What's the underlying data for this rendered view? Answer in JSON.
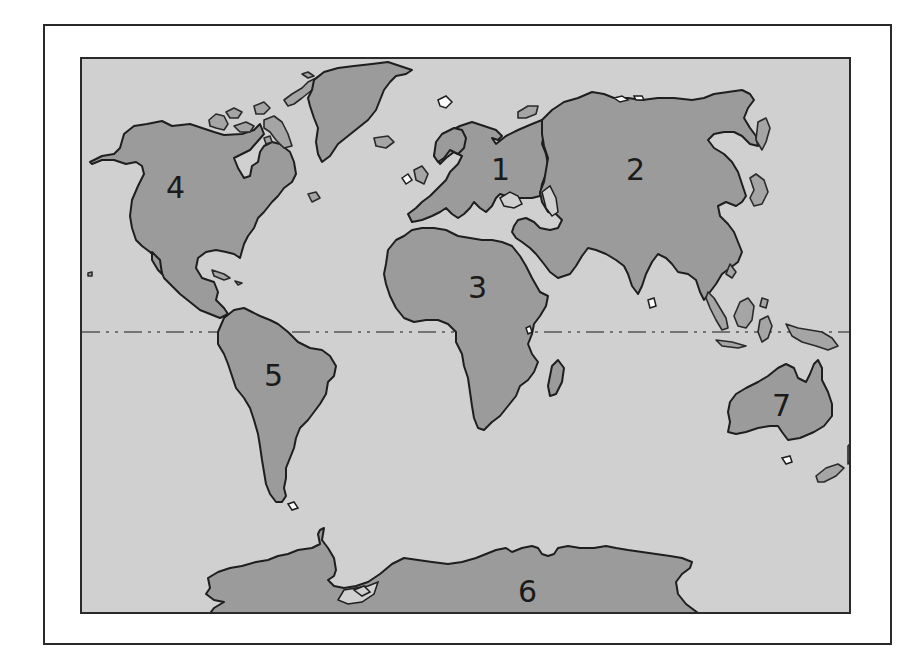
{
  "map": {
    "title": "World continents map",
    "colors": {
      "ocean": "#d0d0d0",
      "land": "#9b9b9b",
      "outline": "#1e1e1e",
      "frame": "#2a2a2a",
      "background": "#ffffff"
    },
    "equator": {
      "style": "dash-dot line",
      "y": 330
    },
    "labels": [
      {
        "id": "1",
        "text": "1",
        "continent": "Europe",
        "x": 490,
        "y": 155
      },
      {
        "id": "2",
        "text": "2",
        "continent": "Asia",
        "x": 625,
        "y": 155
      },
      {
        "id": "3",
        "text": "3",
        "continent": "Africa",
        "x": 467,
        "y": 273
      },
      {
        "id": "4",
        "text": "4",
        "continent": "North America",
        "x": 164,
        "y": 171
      },
      {
        "id": "5",
        "text": "5",
        "continent": "South America",
        "x": 263,
        "y": 360
      },
      {
        "id": "6",
        "text": "6",
        "continent": "Antarctica",
        "x": 517,
        "y": 577
      },
      {
        "id": "7",
        "text": "7",
        "continent": "Australia",
        "x": 771,
        "y": 390
      }
    ]
  }
}
